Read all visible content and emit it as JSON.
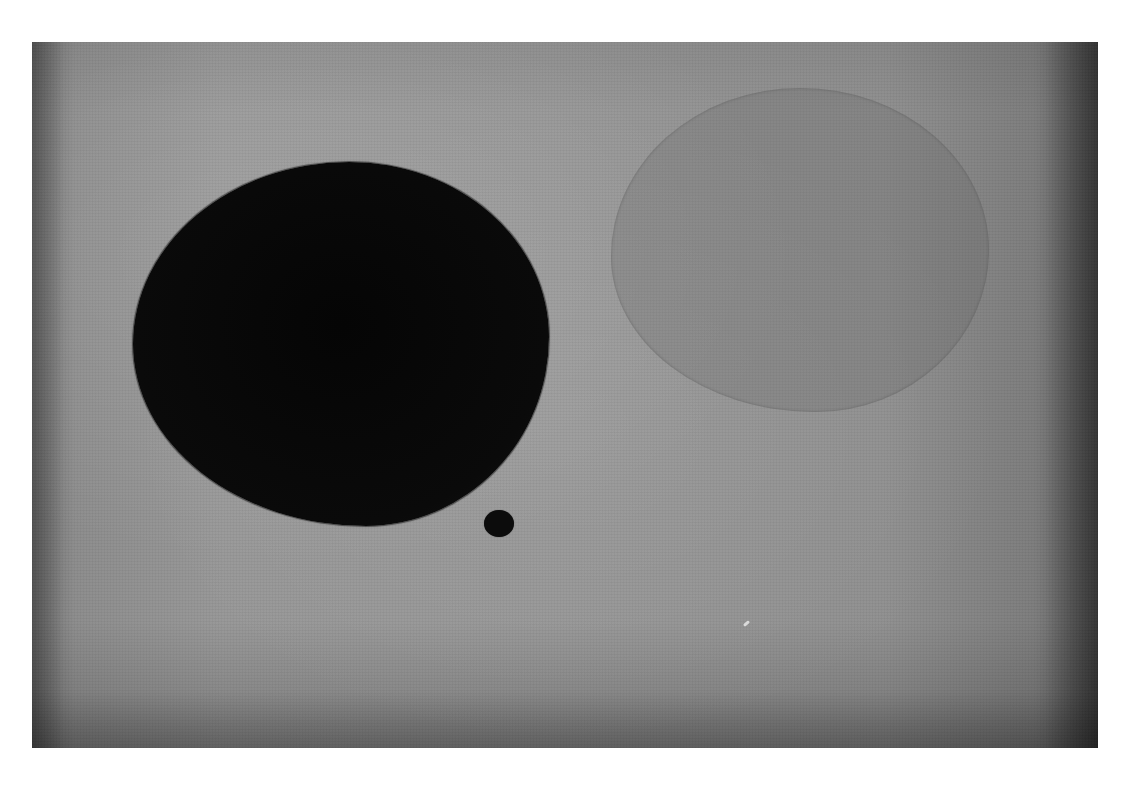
{
  "artwork": {
    "description": "Abstract painting on a mottled gray ground with a large black circle, a small black dot, and a faint darker-gray circle",
    "colors": {
      "ground": "#929292",
      "black_shape": "#0a0a0a",
      "faint_shape": "#858585",
      "border": "#ffffff"
    },
    "shapes": [
      {
        "name": "large-black-circle",
        "cx": 373,
        "cy": 346,
        "rx": 208,
        "ry": 182
      },
      {
        "name": "small-black-dot",
        "cx": 499,
        "cy": 522,
        "r": 14
      },
      {
        "name": "faint-gray-circle",
        "cx": 800,
        "cy": 250,
        "rx": 189,
        "ry": 162
      }
    ]
  }
}
